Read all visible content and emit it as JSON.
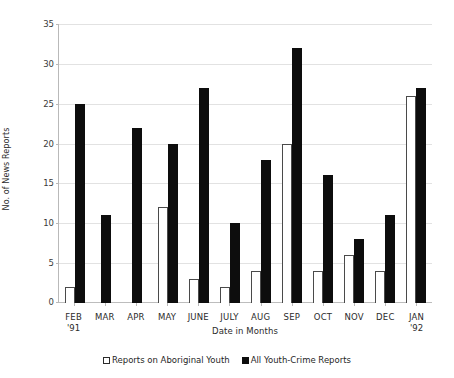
{
  "chart_data": {
    "type": "bar",
    "title": "",
    "xlabel": "Date in Months",
    "ylabel": "No. of News Reports",
    "ylim": [
      0,
      35
    ],
    "yticks": [
      0,
      5,
      10,
      15,
      20,
      25,
      30,
      35
    ],
    "grid": true,
    "legend_position": "bottom",
    "categories": [
      "FEB",
      "MAR",
      "APR",
      "MAY",
      "JUNE",
      "JULY",
      "AUG",
      "SEP",
      "OCT",
      "NOV",
      "DEC",
      "JAN"
    ],
    "category_sublabels": [
      "'91",
      "",
      "",
      "",
      "",
      "",
      "",
      "",
      "",
      "",
      "",
      "'92"
    ],
    "series": [
      {
        "name": "Reports on Aboriginal Youth",
        "color": "#ffffff",
        "values": [
          2,
          0,
          0,
          12,
          3,
          2,
          4,
          20,
          4,
          6,
          4,
          26
        ]
      },
      {
        "name": "All Youth-Crime Reports",
        "color": "#0d0d0d",
        "values": [
          25,
          11,
          22,
          20,
          27,
          10,
          18,
          32,
          16,
          8,
          11,
          27
        ]
      }
    ]
  }
}
